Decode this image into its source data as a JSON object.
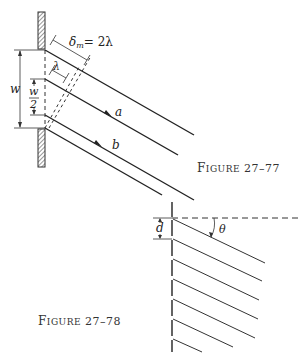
{
  "figures": [
    {
      "id": "fig-27-77",
      "caption": {
        "prefix_big": "F",
        "prefix_small": "IGURE",
        "number": "27–77"
      },
      "labels": {
        "delta": "δ",
        "delta_sub": "m",
        "delta_eq": "= 2λ",
        "lambda": "λ",
        "w": "w",
        "w_half_num": "w",
        "w_half_den": "2",
        "ray_a": "a",
        "ray_b": "b"
      }
    },
    {
      "id": "fig-27-78",
      "caption": {
        "prefix_big": "F",
        "prefix_small": "IGURE",
        "number": "27–78"
      },
      "labels": {
        "d": "d",
        "theta": "θ"
      }
    }
  ],
  "colors": {
    "ink": "#222222",
    "background": "#ffffff"
  }
}
